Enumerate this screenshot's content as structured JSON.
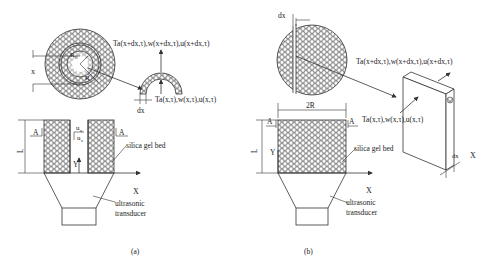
{
  "figure": {
    "panel_a": {
      "caption": "(a)",
      "labels": {
        "top_flux": "Ta(x+dx,τ),w(x+dx,τ),u(x+dx,τ)",
        "bottom_flux": "Ta(x,τ),w(x,τ),u(x,τ)",
        "dx": "dx",
        "x": "x",
        "r0": "R",
        "r0_sub": "0",
        "r": "R",
        "A_left": "A",
        "A_right": "A",
        "L": "L",
        "ua": "u",
        "ua_sub": "a",
        "us": "u",
        "us_sub": "s",
        "Y": "Y",
        "X": "X",
        "bed": "silica gel bed",
        "transducer_1": "ultrasonic",
        "transducer_2": "transducer"
      }
    },
    "panel_b": {
      "caption": "(b)",
      "labels": {
        "dx_top": "dx",
        "top_flux": "Ta(x+dx,τ),w(x+dx,τ),u(x+dx,τ)",
        "bottom_flux": "Ta(x,τ),w(x,τ),u(x,τ)",
        "two_r": "2R",
        "A_left": "A",
        "A_right": "A",
        "L": "L",
        "Y": "Y",
        "X": "X",
        "X_slab": "X",
        "dx_slab": "dx",
        "bed": "silica gel bed",
        "transducer_1": "ultrasonic",
        "transducer_2": "transducer"
      }
    },
    "colors": {
      "line": "#333333",
      "background": "#ffffff"
    }
  }
}
